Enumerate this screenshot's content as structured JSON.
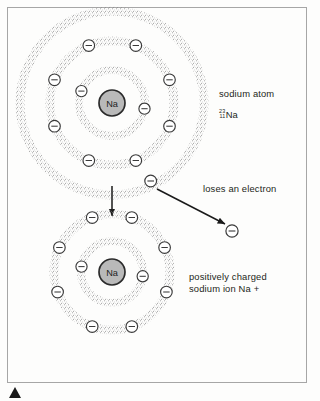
{
  "figure": {
    "title_top": "sodium atom",
    "isotope": {
      "mass_number": "23",
      "atomic_number": "11",
      "symbol": "Na"
    },
    "transition_label": "loses an electron",
    "title_bottom": "positively charged\nsodium ion Na +",
    "nucleus_label": "Na",
    "electron_glyph": "−"
  },
  "colors": {
    "frame": "#a6a6a6",
    "stipple": "#8d8d8d",
    "nucleus_fill": "#b9b9b9",
    "nucleus_stroke": "#2b2b2b",
    "electron_fill": "#ffffff",
    "electron_stroke": "#3a3a3a",
    "arrow": "#1a1a1a",
    "text": "#231f20",
    "page": "#fdfdfc",
    "marker": "#1a1a1a"
  },
  "atom": {
    "name": "sodium-atom",
    "center": {
      "x": 112,
      "y": 103
    },
    "nucleus_radius": 13,
    "shells": [
      {
        "name": "shell-1",
        "radius": 33,
        "electron_count": 2,
        "electron_angles": [
          158,
          10
        ]
      },
      {
        "name": "shell-2",
        "radius": 62,
        "electron_count": 8,
        "electron_angles": [
          248,
          292,
          202,
          338,
          158,
          22,
          112,
          68
        ]
      },
      {
        "name": "shell-3",
        "radius": 92,
        "electron_count": 1,
        "electron_angles": [
          58
        ]
      }
    ]
  },
  "ion": {
    "name": "sodium-ion",
    "center": {
      "x": 112,
      "y": 272
    },
    "nucleus_radius": 13,
    "shells": [
      {
        "name": "shell-1",
        "radius": 31,
        "electron_count": 2,
        "electron_angles": [
          170,
          352
        ]
      },
      {
        "name": "shell-2",
        "radius": 58,
        "electron_count": 8,
        "electron_angles": [
          250,
          290,
          205,
          335,
          160,
          20,
          115,
          65
        ]
      }
    ]
  },
  "free_electron": {
    "name": "free-electron",
    "x": 232,
    "y": 231,
    "radius": 6
  },
  "arrows": [
    {
      "name": "transition-arrow-down",
      "x1": 112,
      "y1": 186,
      "x2": 112,
      "y2": 218
    },
    {
      "name": "electron-transfer-arrow",
      "x1": 156,
      "y1": 190,
      "x2": 226,
      "y2": 225
    }
  ]
}
